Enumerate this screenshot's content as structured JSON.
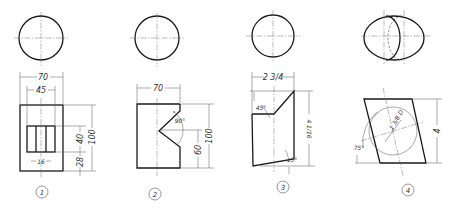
{
  "figures": [
    {
      "id": "1",
      "label": "1",
      "dims": {
        "overall_width": "70",
        "slot_width": "45",
        "slot_height": "40",
        "overall_height": "100",
        "bottom_offset": "28",
        "center_slot": "16"
      }
    },
    {
      "id": "2",
      "label": "2",
      "dims": {
        "overall_width": "70",
        "v_angle": "90°",
        "overall_height": "100",
        "vertex_height": "60"
      }
    },
    {
      "id": "3",
      "label": "3",
      "dims": {
        "overall_width": "2 3/4",
        "top_angle": "45°",
        "overall_height": "4 1/16",
        "bottom_angle": "15°"
      }
    },
    {
      "id": "4",
      "label": "4",
      "dims": {
        "hole_diameter": "1 3/8 D",
        "tilt_angle": "75°",
        "overall_height": "4"
      }
    }
  ],
  "colors": {
    "line": "#1a1a1a",
    "thin": "#555555",
    "background": "#ffffff"
  }
}
